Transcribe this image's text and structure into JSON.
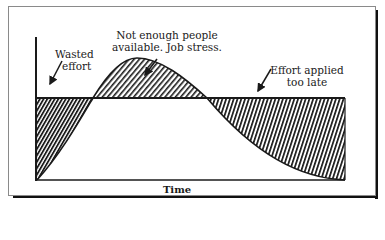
{
  "diagram": {
    "type": "effort-vs-time curve",
    "annotations": {
      "wasted_effort": {
        "line1": "Wasted",
        "line2": "effort"
      },
      "not_enough_people": {
        "line1": "Not enough people",
        "line2": "available. Job stress."
      },
      "effort_late": {
        "line1": "Effort applied",
        "line2": "too late"
      }
    },
    "x_axis_label": "Time",
    "colors": {
      "ink": "#1a1a1a",
      "frame": "#8a8a8a",
      "shadow": "#111111",
      "background": "#ffffff"
    }
  }
}
